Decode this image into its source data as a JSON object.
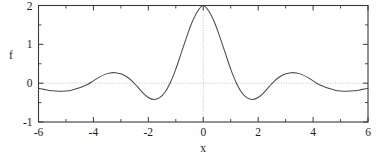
{
  "chart_data": {
    "type": "line",
    "title": "",
    "xlabel": "x",
    "ylabel": "f",
    "xlim": [
      -6,
      6
    ],
    "ylim": [
      -1,
      2
    ],
    "grid": "dotted reference lines at x=0 and y=0",
    "legend": "none",
    "xticks": [
      -6,
      -4,
      -2,
      0,
      2,
      4,
      6
    ],
    "xtick_labels": [
      "-6",
      "-4",
      "-2",
      "0",
      "2",
      "4",
      "6"
    ],
    "xticks_minor": [
      -5,
      -3,
      -1,
      1,
      3,
      5
    ],
    "yticks": [
      -1,
      0,
      1,
      2
    ],
    "ytick_labels": [
      "-1",
      "0",
      "1",
      "2"
    ],
    "yticks_minor": [
      -0.5,
      0.5,
      1.5
    ],
    "series": [
      {
        "name": "f(x)",
        "description": "damped oscillation, even symmetric, central peak 2 at x=0",
        "x": [
          -6.0,
          -5.8,
          -5.6,
          -5.4,
          -5.2,
          -5.0,
          -4.8,
          -4.6,
          -4.4,
          -4.2,
          -4.0,
          -3.8,
          -3.6,
          -3.4,
          -3.2,
          -3.0,
          -2.8,
          -2.6,
          -2.4,
          -2.2,
          -2.0,
          -1.8,
          -1.6,
          -1.4,
          -1.2,
          -1.0,
          -0.8,
          -0.6,
          -0.4,
          -0.2,
          0.0,
          0.2,
          0.4,
          0.6,
          0.8,
          1.0,
          1.2,
          1.4,
          1.6,
          1.8,
          2.0,
          2.2,
          2.4,
          2.6,
          2.8,
          3.0,
          3.2,
          3.4,
          3.6,
          3.8,
          4.0,
          4.2,
          4.4,
          4.6,
          4.8,
          5.0,
          5.2,
          5.4,
          5.6,
          5.8,
          6.0
        ],
        "y": [
          -0.13,
          -0.16,
          -0.19,
          -0.2,
          -0.21,
          -0.2,
          -0.18,
          -0.14,
          -0.09,
          -0.03,
          0.06,
          0.15,
          0.22,
          0.26,
          0.27,
          0.24,
          0.17,
          0.06,
          -0.09,
          -0.25,
          -0.37,
          -0.42,
          -0.38,
          -0.24,
          0.01,
          0.36,
          0.78,
          1.2,
          1.58,
          1.86,
          2.0,
          1.86,
          1.58,
          1.2,
          0.78,
          0.36,
          0.01,
          -0.24,
          -0.38,
          -0.42,
          -0.37,
          -0.25,
          -0.09,
          0.06,
          0.17,
          0.24,
          0.27,
          0.26,
          0.22,
          0.15,
          0.06,
          -0.03,
          -0.09,
          -0.14,
          -0.18,
          -0.2,
          -0.21,
          -0.2,
          -0.19,
          -0.16,
          -0.13
        ],
        "peak_value": 2.0,
        "peak_x": 0.0,
        "zero_crossings": [
          -4.25,
          -1.45,
          1.45,
          4.25
        ],
        "minima": [
          {
            "x": -2.25,
            "y": -0.42
          },
          {
            "x": 2.25,
            "y": -0.42
          }
        ],
        "side_maxima": [
          {
            "x": -3.2,
            "y": 0.27
          },
          {
            "x": 3.2,
            "y": 0.27
          }
        ],
        "color": "#4a4a4a"
      }
    ]
  },
  "axes": {
    "ylabel_text": "f",
    "xlabel_text": "x"
  }
}
